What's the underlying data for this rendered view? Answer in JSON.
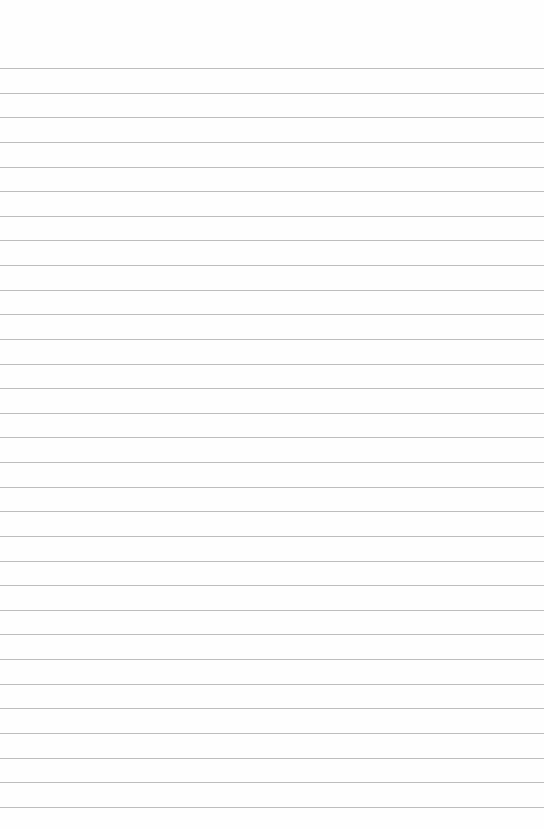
{
  "page": {
    "type": "lined-paper",
    "background_color": "#fefefe",
    "line_color": "#bdbdbd",
    "first_line_y": 68,
    "line_spacing": 24.63,
    "line_count": 31
  }
}
